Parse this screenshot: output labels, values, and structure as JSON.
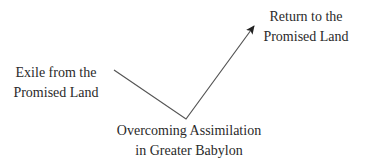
{
  "diagram": {
    "type": "flow-arrow",
    "nodes": [
      {
        "id": "exile",
        "lines": [
          "Exile from the",
          "Promised Land"
        ]
      },
      {
        "id": "overcoming",
        "lines": [
          "Overcoming Assimilation",
          "in Greater Babylon"
        ]
      },
      {
        "id": "return",
        "lines": [
          "Return to the",
          "Promised Land"
        ]
      }
    ],
    "path": {
      "points": [
        [
          114,
          70
        ],
        [
          186,
          119
        ],
        [
          254,
          26
        ]
      ],
      "stroke_color": "#555555",
      "arrowhead": "end"
    }
  }
}
